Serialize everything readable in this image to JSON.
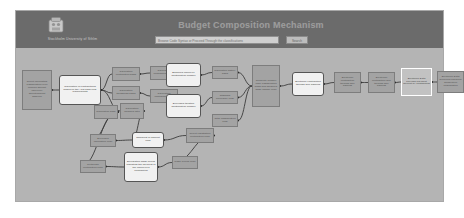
{
  "header": {
    "org_name": "Stockholm University of Sthlm",
    "site_title": "Budget Composition Mechanism",
    "logo_icon": "institution-crest-icon",
    "search": {
      "placeholder": "Browse Code Syntax or Proceed Through the classifications",
      "button_label": "Search"
    }
  },
  "diagram": {
    "title": "Budget Composition Mechanism",
    "nodes": [
      {
        "id": "n1",
        "label": "Select calculating classification level formula amount carryover apportionment baseline",
        "shape": "square",
        "x": 6,
        "y": 22,
        "w": 30,
        "h": 40
      },
      {
        "id": "n2",
        "label": "Calculation of contributions based on the APR base final requirements",
        "shape": "rounded",
        "x": 43,
        "y": 27,
        "w": 42,
        "h": 30
      },
      {
        "id": "n3",
        "label": "Calculation contribution basis",
        "shape": "square",
        "x": 96,
        "y": 19,
        "w": 28,
        "h": 14
      },
      {
        "id": "n4",
        "label": "Calculation contribution levels",
        "shape": "square",
        "x": 134,
        "y": 18,
        "w": 28,
        "h": 14
      },
      {
        "id": "n5",
        "label": "Calculation thresholds basis",
        "shape": "square",
        "x": 96,
        "y": 38,
        "w": 28,
        "h": 14
      },
      {
        "id": "n6",
        "label": "Calculation contribution total",
        "shape": "square",
        "x": 134,
        "y": 41,
        "w": 28,
        "h": 14
      },
      {
        "id": "n7",
        "label": "Calculation base",
        "shape": "square",
        "x": 78,
        "y": 57,
        "w": 24,
        "h": 14
      },
      {
        "id": "n8",
        "label": "Calculation modified ratio",
        "shape": "square",
        "x": 104,
        "y": 55,
        "w": 24,
        "h": 16
      },
      {
        "id": "n9",
        "label": "Balanced employer identification number",
        "shape": "rounded",
        "x": 150,
        "y": 15,
        "w": 35,
        "h": 24
      },
      {
        "id": "n10",
        "label": "Exercised taxation identification number",
        "shape": "rounded",
        "x": 150,
        "y": 46,
        "w": 35,
        "h": 24
      },
      {
        "id": "n11",
        "label": "Calculation history basis",
        "shape": "square",
        "x": 196,
        "y": 18,
        "w": 26,
        "h": 13
      },
      {
        "id": "n12",
        "label": "Standard procedure code",
        "shape": "square",
        "x": 196,
        "y": 43,
        "w": 26,
        "h": 13
      },
      {
        "id": "n13",
        "label": "Total classification code",
        "shape": "square",
        "x": 196,
        "y": 66,
        "w": 26,
        "h": 13
      },
      {
        "id": "n14",
        "label": "Complete number code classification basis and balanced wage charge code",
        "shape": "square",
        "x": 236,
        "y": 17,
        "w": 28,
        "h": 42
      },
      {
        "id": "n15",
        "label": "Electronic contribution through wire banking",
        "shape": "rounded",
        "x": 276,
        "y": 24,
        "w": 32,
        "h": 24
      },
      {
        "id": "n16",
        "label": "Electronic contribution through wire banking",
        "shape": "square",
        "x": 318,
        "y": 24,
        "w": 27,
        "h": 21
      },
      {
        "id": "n17",
        "label": "Electronic contribution wire through wire banking",
        "shape": "square",
        "x": 352,
        "y": 24,
        "w": 27,
        "h": 21
      },
      {
        "id": "n18",
        "label": "Electronic Data Payload Payment Receipt by contributors",
        "shape": "highlight",
        "x": 385,
        "y": 20,
        "w": 31,
        "h": 28
      },
      {
        "id": "n19",
        "label": "Electronic Data Received Payment Completion confirmation",
        "shape": "square",
        "x": 421,
        "y": 23,
        "w": 27,
        "h": 22
      },
      {
        "id": "n20",
        "label": "Exercised calculation code",
        "shape": "square",
        "x": 74,
        "y": 86,
        "w": 26,
        "h": 13
      },
      {
        "id": "n21",
        "label": "Shipment of amount paid",
        "shape": "rounded",
        "x": 116,
        "y": 84,
        "w": 32,
        "h": 16
      },
      {
        "id": "n22",
        "label": "Select registration contribution code",
        "shape": "square",
        "x": 170,
        "y": 80,
        "w": 28,
        "h": 15
      },
      {
        "id": "n23",
        "label": "Certificate contribution code",
        "shape": "square",
        "x": 64,
        "y": 112,
        "w": 26,
        "h": 13
      },
      {
        "id": "n24",
        "label": "Declaration wage period indicating the payment of the employer's contribution",
        "shape": "rounded",
        "x": 108,
        "y": 104,
        "w": 34,
        "h": 30
      },
      {
        "id": "n25",
        "label": "Wage Period code",
        "shape": "square",
        "x": 156,
        "y": 108,
        "w": 26,
        "h": 13
      }
    ],
    "edges": [
      [
        "n1",
        "n2"
      ],
      [
        "n2",
        "n3"
      ],
      [
        "n2",
        "n5"
      ],
      [
        "n3",
        "n4"
      ],
      [
        "n5",
        "n6"
      ],
      [
        "n2",
        "n7"
      ],
      [
        "n2",
        "n8"
      ],
      [
        "n4",
        "n9"
      ],
      [
        "n6",
        "n10"
      ],
      [
        "n9",
        "n11"
      ],
      [
        "n10",
        "n12"
      ],
      [
        "n11",
        "n14"
      ],
      [
        "n12",
        "n14"
      ],
      [
        "n13",
        "n14"
      ],
      [
        "n14",
        "n15"
      ],
      [
        "n15",
        "n16"
      ],
      [
        "n16",
        "n17"
      ],
      [
        "n17",
        "n18"
      ],
      [
        "n18",
        "n19"
      ],
      [
        "n7",
        "n20"
      ],
      [
        "n8",
        "n21"
      ],
      [
        "n20",
        "n21"
      ],
      [
        "n21",
        "n22"
      ],
      [
        "n7",
        "n23"
      ],
      [
        "n23",
        "n24"
      ],
      [
        "n24",
        "n25"
      ],
      [
        "n22",
        "n25"
      ]
    ]
  }
}
